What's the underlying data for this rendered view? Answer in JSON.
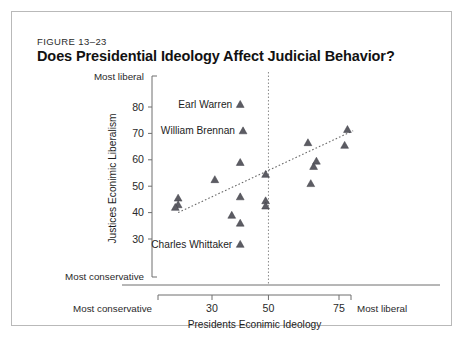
{
  "figure": {
    "number": "FIGURE 13–23",
    "title": "Does Presidential Ideology Affect Judicial Behavior?"
  },
  "chart_data": {
    "type": "scatter",
    "title": "Does Presidential Ideology Affect Judicial Behavior?",
    "xlabel": "Presidents Econimic Ideology",
    "ylabel": "Justices Econimic Liberalism",
    "xlim": [
      13,
      83
    ],
    "ylim": [
      22,
      88
    ],
    "grid": false,
    "legend": null,
    "x_ticks": [
      30,
      50,
      75
    ],
    "x_tick_labels": [
      "30",
      "50",
      "75"
    ],
    "y_ticks": [
      30,
      40,
      50,
      60,
      70,
      80
    ],
    "y_tick_labels": [
      "30",
      "40",
      "50",
      "60",
      "70",
      "80"
    ],
    "x_axis_low_label": "Most conservative",
    "x_axis_high_label": "Most liberal",
    "y_axis_low_label": "Most conservative",
    "y_axis_high_label": "Most liberal",
    "reference_line": {
      "orientation": "vertical",
      "x": 50,
      "style": "dotted"
    },
    "trendline": {
      "style": "dotted",
      "x_start": 18,
      "y_start": 40.0,
      "x_end": 80,
      "y_end": 71.0
    },
    "points": [
      {
        "x": 40,
        "y": 81.0,
        "label": "Earl Warren"
      },
      {
        "x": 41,
        "y": 71.0,
        "label": "William Brennan"
      },
      {
        "x": 40,
        "y": 28.0,
        "label": "Charles Whittaker"
      },
      {
        "x": 18,
        "y": 45.5,
        "label": ""
      },
      {
        "x": 18,
        "y": 43.0,
        "label": ""
      },
      {
        "x": 17,
        "y": 42.0,
        "label": ""
      },
      {
        "x": 31,
        "y": 52.5,
        "label": ""
      },
      {
        "x": 37,
        "y": 39.0,
        "label": ""
      },
      {
        "x": 40,
        "y": 59.0,
        "label": ""
      },
      {
        "x": 40,
        "y": 46.0,
        "label": ""
      },
      {
        "x": 40,
        "y": 36.0,
        "label": ""
      },
      {
        "x": 49,
        "y": 54.5,
        "label": ""
      },
      {
        "x": 49,
        "y": 44.5,
        "label": ""
      },
      {
        "x": 49,
        "y": 42.5,
        "label": ""
      },
      {
        "x": 64,
        "y": 66.5,
        "label": ""
      },
      {
        "x": 66,
        "y": 57.5,
        "label": ""
      },
      {
        "x": 67,
        "y": 59.5,
        "label": ""
      },
      {
        "x": 65,
        "y": 51.0,
        "label": ""
      },
      {
        "x": 78,
        "y": 71.5,
        "label": ""
      },
      {
        "x": 77,
        "y": 65.5,
        "label": ""
      }
    ]
  }
}
